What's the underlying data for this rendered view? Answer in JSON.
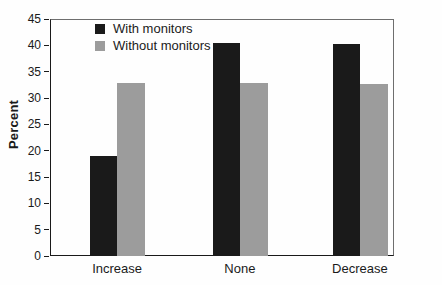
{
  "chart_data": {
    "type": "bar",
    "title": "",
    "xlabel": "",
    "ylabel": "Percent",
    "categories": [
      "Increase",
      "None",
      "Decrease"
    ],
    "series": [
      {
        "name": "With monitors",
        "color": "#1a1a1a",
        "values": [
          19.0,
          40.4,
          40.2
        ]
      },
      {
        "name": "Without monitors",
        "color": "#9c9c9c",
        "values": [
          32.9,
          32.9,
          32.7
        ]
      }
    ],
    "ylim": [
      0,
      45
    ],
    "yticks": [
      0,
      5,
      10,
      15,
      20,
      25,
      30,
      35,
      40,
      45
    ],
    "grid": false,
    "legend_position": "top-left-inside",
    "frame": true
  }
}
